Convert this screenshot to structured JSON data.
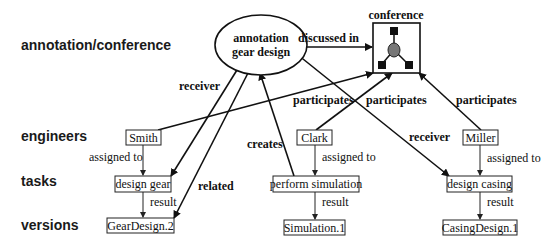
{
  "row_labels": {
    "annotation": "annotation/conference",
    "engineers": "engineers",
    "tasks": "tasks",
    "versions": "versions"
  },
  "annotation_node": {
    "line1": "annotation",
    "line2": "gear design"
  },
  "conference_node": {
    "label": "conference",
    "icon": "conference-network-icon"
  },
  "engineers": [
    {
      "name": "Smith"
    },
    {
      "name": "Clark"
    },
    {
      "name": "Miller"
    }
  ],
  "tasks": [
    {
      "name": "design gear"
    },
    {
      "name": "perform simulation"
    },
    {
      "name": "design casing"
    }
  ],
  "versions": [
    {
      "name": "GearDesign.2"
    },
    {
      "name": "Simulation.1"
    },
    {
      "name": "CasingDesign.1"
    }
  ],
  "edge_labels": {
    "discussed_in": "discussed in",
    "receiver_left": "receiver",
    "receiver_right": "receiver",
    "related": "related",
    "creates": "creates",
    "participates_1": "participates",
    "participates_2": "participates",
    "participates_3": "participates",
    "assigned_to_1": "assigned to",
    "assigned_to_2": "assigned to",
    "assigned_to_3": "assigned to",
    "result_1": "result",
    "result_2": "result",
    "result_3": "result"
  }
}
